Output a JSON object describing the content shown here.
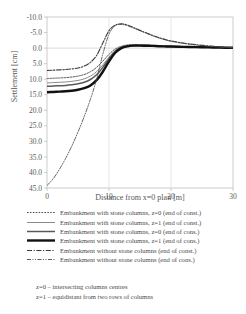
{
  "chart_data": {
    "type": "line",
    "title": "",
    "xlabel": "Distance from x=0 plan [m]",
    "ylabel": "Settlement [cm]",
    "xlim": [
      0,
      30
    ],
    "ylim": [
      -10.0,
      45.0
    ],
    "y_axis_inverted": true,
    "grid": false,
    "legend_position": "bottom",
    "xticks": [
      "0",
      "10",
      "20",
      "30"
    ],
    "xtick_values": [
      0,
      10,
      20,
      30
    ],
    "yticks": [
      "-10.0",
      "-5.0",
      "0.0",
      "5.0",
      "10.0",
      "15.0",
      "20.0",
      "25.0",
      "30.0",
      "35.0",
      "40.0",
      "45.0"
    ],
    "ytick_values": [
      -10,
      -5,
      0,
      5,
      10,
      15,
      20,
      25,
      30,
      35,
      40,
      45
    ],
    "x": [
      0,
      1,
      2,
      3,
      4,
      5,
      6,
      7,
      8,
      9,
      10,
      11,
      12,
      13,
      14,
      15,
      16,
      17,
      18,
      19,
      20,
      22,
      24,
      26,
      28,
      30
    ],
    "series": [
      {
        "name": "Embankment with stone columns, z=0 (end of const.)",
        "style": "dotted-thin",
        "color": "#3a3a3a",
        "values": [
          9.8,
          9.7,
          9.6,
          9.5,
          9.3,
          9.0,
          8.5,
          7.6,
          6.2,
          4.2,
          2.0,
          0.3,
          -0.6,
          -1.0,
          -1.1,
          -1.1,
          -1.0,
          -0.9,
          -0.8,
          -0.7,
          -0.6,
          -0.5,
          -0.4,
          -0.3,
          -0.2,
          -0.1
        ]
      },
      {
        "name": "Embankment with stone columns, z=1 (end of const.)",
        "style": "solid-thin",
        "color": "#8a8a8a",
        "values": [
          11.2,
          11.1,
          11.0,
          10.9,
          10.7,
          10.4,
          9.9,
          9.0,
          7.6,
          5.4,
          2.9,
          0.8,
          -0.3,
          -0.8,
          -0.9,
          -0.9,
          -0.8,
          -0.7,
          -0.6,
          -0.55,
          -0.5,
          -0.4,
          -0.3,
          -0.25,
          -0.2,
          -0.1
        ]
      },
      {
        "name": "Embankment with stone columns, z=0 (end of cons.)",
        "style": "solid-mid",
        "color": "#5a5a5a",
        "values": [
          12.3,
          12.2,
          12.1,
          12.0,
          11.8,
          11.5,
          11.0,
          10.1,
          8.6,
          6.2,
          3.4,
          1.0,
          -0.2,
          -0.7,
          -0.85,
          -0.85,
          -0.8,
          -0.7,
          -0.6,
          -0.55,
          -0.5,
          -0.4,
          -0.3,
          -0.25,
          -0.15,
          -0.1
        ]
      },
      {
        "name": "Embankment with stone columns, z=1 (end of cons.)",
        "style": "solid-thick",
        "color": "#111111",
        "values": [
          14.2,
          14.1,
          14.0,
          13.9,
          13.7,
          13.4,
          12.9,
          12.0,
          10.3,
          7.6,
          4.3,
          1.5,
          0.0,
          -0.6,
          -0.8,
          -0.8,
          -0.75,
          -0.7,
          -0.6,
          -0.55,
          -0.5,
          -0.4,
          -0.3,
          -0.25,
          -0.15,
          -0.1
        ]
      },
      {
        "name": "Embankment without stone columns (end of const.)",
        "style": "dashdot-mid",
        "color": "#3a3a3a",
        "values": [
          7.2,
          7.1,
          7.0,
          6.9,
          6.7,
          6.4,
          5.8,
          4.6,
          2.4,
          -1.6,
          -5.6,
          -7.4,
          -7.8,
          -7.4,
          -6.6,
          -5.7,
          -4.9,
          -4.1,
          -3.4,
          -2.8,
          -2.3,
          -1.6,
          -1.1,
          -0.7,
          -0.4,
          -0.1
        ]
      },
      {
        "name": "Embankment without stone columns (end of cons.)",
        "style": "dashdotdot-thin",
        "color": "#4a4a4a",
        "values": [
          44.2,
          42.0,
          39.0,
          35.5,
          31.5,
          27.0,
          22.0,
          16.5,
          10.0,
          2.0,
          -4.5,
          -7.2,
          -7.6,
          -7.2,
          -6.4,
          -5.6,
          -4.8,
          -4.0,
          -3.3,
          -2.7,
          -2.2,
          -1.5,
          -1.0,
          -0.6,
          -0.35,
          -0.1
        ]
      }
    ],
    "notes": [
      "z=0 – intersecting columns centres",
      "z=1 – equidistant from two rows of columns"
    ]
  },
  "legend": {
    "items": [
      {
        "label": "Embankment with stone columns, z=0 (end of const.)",
        "style": "dotted-thin"
      },
      {
        "label": "Embankment with stone columns, z=1 (end of const.)",
        "style": "solid-thin"
      },
      {
        "label": "Embankment with stone columns, z=0 (end of cons.)",
        "style": "solid-mid"
      },
      {
        "label": "Embankment with stone columns, z=1 (end of cons.)",
        "style": "solid-thick"
      },
      {
        "label": "Embankment without stone columns (end of const.)",
        "style": "dashdot-mid"
      },
      {
        "label": "Embankment without stone columns (end of cons.)",
        "style": "dashdotdot-thin"
      }
    ]
  },
  "notes": [
    "z=0 – intersecting columns centres",
    "z=1 – equidistant from two rows of columns"
  ],
  "colors": {
    "axis": "#bfbfbf",
    "text": "#4a4a4a",
    "zero_line": "#d0d0d0"
  }
}
